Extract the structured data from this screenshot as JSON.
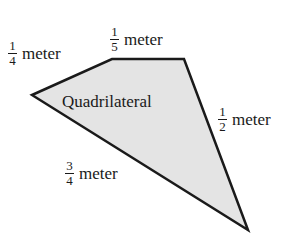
{
  "figure": {
    "shape_label": "Quadrilateral",
    "fill_color": "#e4e4e4",
    "stroke_color": "#1a1a1a",
    "vertices": [
      [
        32,
        95
      ],
      [
        112,
        59
      ],
      [
        184,
        59
      ],
      [
        248,
        230
      ]
    ],
    "sides": [
      {
        "id": "left-top",
        "numerator": "1",
        "denominator": "4",
        "unit": "meter"
      },
      {
        "id": "top",
        "numerator": "1",
        "denominator": "5",
        "unit": "meter"
      },
      {
        "id": "right",
        "numerator": "1",
        "denominator": "2",
        "unit": "meter"
      },
      {
        "id": "bottom-left",
        "numerator": "3",
        "denominator": "4",
        "unit": "meter"
      }
    ]
  }
}
